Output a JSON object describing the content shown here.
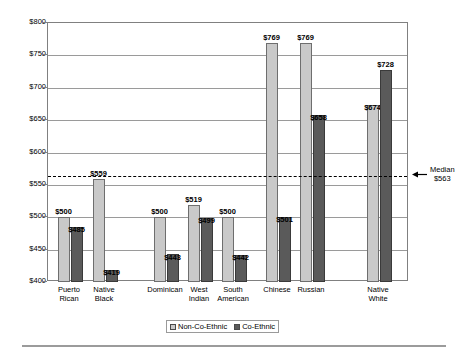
{
  "chart_data": {
    "type": "bar",
    "title": "",
    "xlabel": "",
    "ylabel": "",
    "ylim": [
      400,
      800
    ],
    "ytick_step": 50,
    "ytick_labels": [
      "$800",
      "$750",
      "$700",
      "$650",
      "$600",
      "$550",
      "$500",
      "$450",
      "$400"
    ],
    "ytick_values": [
      800,
      750,
      700,
      650,
      600,
      550,
      500,
      450,
      400
    ],
    "grid": true,
    "legend_position": "bottom",
    "categories": [
      "Puerto Rican",
      "Native Black",
      "Dominican",
      "West Indian",
      "South American",
      "Chinese",
      "Russian",
      "Native White"
    ],
    "category_lines": [
      [
        "Puerto",
        "Rican"
      ],
      [
        "Native",
        "Black"
      ],
      [
        "Dominican",
        ""
      ],
      [
        "West",
        "Indian"
      ],
      [
        "South",
        "American"
      ],
      [
        "Chinese",
        ""
      ],
      [
        "Russian",
        ""
      ],
      [
        "Native",
        "White"
      ]
    ],
    "series": [
      {
        "name": "Non-Co-Ethnic",
        "color": "#c9c9c9",
        "values": [
          500,
          559,
          500,
          519,
          500,
          769,
          769,
          674
        ],
        "value_labels": [
          "$500",
          "$559",
          "$500",
          "$519",
          "$500",
          "$769",
          "$769",
          "$674"
        ]
      },
      {
        "name": "Co-Ethnic",
        "color": "#5a5a5a",
        "values": [
          485,
          419,
          443,
          499,
          442,
          501,
          658,
          728
        ],
        "value_labels": [
          "$485",
          "$419",
          "$443",
          "$499",
          "$442",
          "$501",
          "$658",
          "$728"
        ]
      }
    ],
    "annotations": [
      {
        "name": "median-line",
        "type": "hline",
        "value": 563,
        "label_line1": "Median",
        "label_line2": "$563",
        "style": "dashed"
      }
    ]
  },
  "legend": {
    "items": [
      {
        "label": "Non-Co-Ethnic",
        "swatch": "light"
      },
      {
        "label": "Co-Ethnic",
        "swatch": "dark"
      }
    ]
  }
}
